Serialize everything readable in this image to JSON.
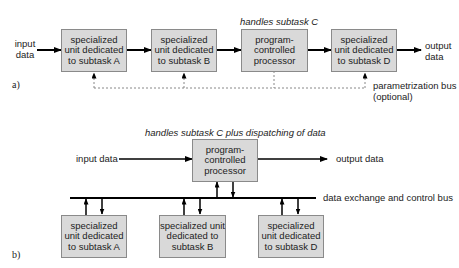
{
  "diagram_a": {
    "panel_label": "a)",
    "input_label": "input data",
    "output_label": "output data",
    "processor_note": "handles subtask C",
    "boxes": [
      {
        "id": "unit-a",
        "label": "specialized unit dedicated to subtask A"
      },
      {
        "id": "unit-b",
        "label": "specialized unit dedicated to subtask B"
      },
      {
        "id": "processor",
        "label": "program-controlled processor"
      },
      {
        "id": "unit-d",
        "label": "specialized unit dedicated to subtask D"
      }
    ],
    "bus_label_line1": "parametrization bus",
    "bus_label_line2": "(optional)"
  },
  "diagram_b": {
    "panel_label": "b)",
    "processor_note": "handles subtask C plus dispatching of data",
    "input_label": "input data",
    "output_label": "output data",
    "processor_label": "program-controlled processor",
    "bus_label": "data exchange and control bus",
    "units": [
      {
        "id": "unit-a",
        "label": "specialized unit dedicated to subtask A"
      },
      {
        "id": "unit-b",
        "label": "specialized unit dedicated to subtask B"
      },
      {
        "id": "unit-d",
        "label": "specialized unit dedicated to subtask D"
      }
    ]
  },
  "colors": {
    "box_fill": "#d9d9d9",
    "box_border": "#8a8a8a",
    "line": "#000000",
    "dashed_line": "#888888"
  }
}
